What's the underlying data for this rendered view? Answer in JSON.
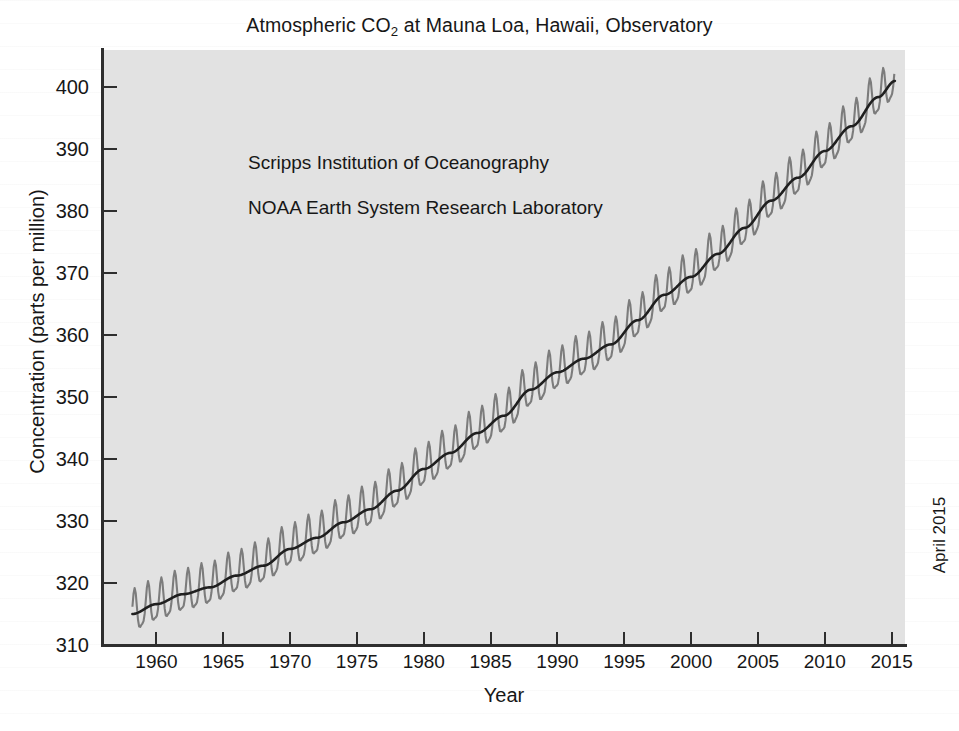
{
  "figure": {
    "title_prefix": "Atmospheric CO",
    "title_sub": "2",
    "title_suffix": " at Mauna Loa, Hawaii, Observatory",
    "title_plain": "Atmospheric CO2 at Mauna Loa, Hawaii, Observatory",
    "date_stamp": "April 2015",
    "plot_background": "#e2e2e2",
    "page_background": "#ffffff",
    "axis_color": "#2e2e2e",
    "monthly_series_color": "#7c7c7c",
    "trend_series_color": "#1f1f1f"
  },
  "annotations": [
    "Scripps Institution of Oceanography",
    "NOAA Earth System Research Laboratory"
  ],
  "axes": {
    "x": {
      "label": "Year",
      "ticks": [
        1960,
        1965,
        1970,
        1975,
        1980,
        1985,
        1990,
        1995,
        2000,
        2005,
        2010,
        2015
      ],
      "tick_labels": [
        "1960",
        "1965",
        "1970",
        "1975",
        "1980",
        "1985",
        "1990",
        "1995",
        "2000",
        "2005",
        "2010",
        "2015"
      ],
      "min": 1956.0,
      "max": 2016.0
    },
    "y": {
      "label": "Concentration (parts per million)",
      "ticks": [
        310,
        320,
        330,
        340,
        350,
        360,
        370,
        380,
        390,
        400
      ],
      "tick_labels": [
        "310",
        "320",
        "330",
        "340",
        "350",
        "360",
        "370",
        "380",
        "390",
        "400"
      ],
      "min": 310.0,
      "max": 406.0
    }
  },
  "chart_data": {
    "type": "line",
    "title": "Atmospheric CO2 at Mauna Loa, Hawaii, Observatory",
    "xlabel": "Year",
    "ylabel": "Concentration (parts per million)",
    "xlim": [
      1956.0,
      2016.0
    ],
    "ylim": [
      310.0,
      406.0
    ],
    "grid": false,
    "legend": null,
    "annotations": [
      "Scripps Institution of Oceanography",
      "NOAA Earth System Research Laboratory"
    ],
    "seasonal_amplitude_ppm": 3.2,
    "seasonal_peak_month": 5,
    "x_start": 1958.2,
    "x_end": 2015.25,
    "series": [
      {
        "name": "Monthly mean CO2 (ppm)",
        "style": "sawtooth-monthly",
        "color": "#7c7c7c",
        "note": "Monthly averages showing the seasonal cycle superimposed on the long-term trend"
      },
      {
        "name": "Seasonally corrected trend (ppm)",
        "style": "smooth-trend",
        "color": "#1f1f1f",
        "note": "Smoothed long-term trend line"
      }
    ],
    "trend_x": [
      1958.2,
      1960,
      1962,
      1964,
      1966,
      1968,
      1970,
      1972,
      1974,
      1976,
      1978,
      1980,
      1982,
      1984,
      1986,
      1988,
      1990,
      1992,
      1994,
      1996,
      1998,
      2000,
      2002,
      2004,
      2006,
      2008,
      2010,
      2012,
      2014,
      2015.25
    ],
    "trend_y": [
      315.0,
      316.6,
      318.2,
      319.3,
      321.2,
      322.8,
      325.5,
      327.3,
      329.8,
      331.9,
      334.9,
      338.4,
      341.0,
      344.2,
      347.0,
      351.2,
      354.0,
      356.2,
      358.5,
      362.4,
      366.5,
      369.4,
      373.1,
      377.3,
      381.7,
      385.4,
      389.7,
      393.7,
      398.4,
      401.0
    ],
    "first_point": {
      "x": 1958.2,
      "y": 315.0
    },
    "last_point": {
      "x": 2015.25,
      "y": 401.0
    }
  }
}
